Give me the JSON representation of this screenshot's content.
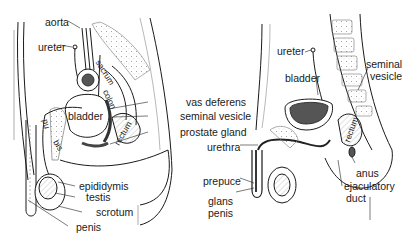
{
  "diagram": {
    "type": "anatomical-illustration",
    "panels": [
      {
        "id": "left",
        "labels": {
          "aorta": "aorta",
          "ureter": "ureter",
          "sacrum": "sacrum",
          "colon": "colon",
          "bladder": "bladder",
          "rectum": "rectum",
          "pubis_a": "pu",
          "pubis_b": "bis",
          "vas_deferens": "vas deferens",
          "seminal_vesicle": "seminal vesicle",
          "prostate_gland": "prostate gland",
          "epididymis": "epididymis",
          "testis": "testis",
          "scrotum": "scrotum",
          "penis": "penis"
        }
      },
      {
        "id": "right",
        "labels": {
          "ureter": "ureter",
          "bladder": "bladder",
          "seminal_vesicle_1": "seminal",
          "seminal_vesicle_2": "vesicle",
          "rectum": "rectum",
          "urethra": "urethra",
          "prepuce": "prepuce",
          "glans_1": "glans",
          "glans_2": "penis",
          "anus": "anus",
          "ejaculatory_1": "ejaculatory",
          "ejaculatory_2": "duct"
        }
      }
    ]
  },
  "colors": {
    "ink": "#1a1a1a",
    "shade": "#555555",
    "background": "#ffffff"
  }
}
